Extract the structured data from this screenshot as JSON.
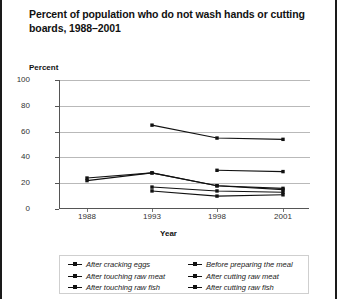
{
  "title": "Percent of population who do not wash hands or cutting boards, 1988–2001",
  "axis": {
    "y_label": "Percent",
    "x_label": "Year",
    "y_ticks": [
      "100",
      "80",
      "60",
      "40",
      "20",
      "0"
    ],
    "x_ticks": [
      "1988",
      "1993",
      "1998",
      "2001"
    ]
  },
  "legend": {
    "left": [
      "After cracking eggs",
      "After touching raw meat",
      "After touching raw fish"
    ],
    "right": [
      "Before preparing the meal",
      "After cutting raw meat",
      "After cutting raw fish"
    ]
  },
  "chart_data": {
    "type": "line",
    "title": "Percent of population who do not wash hands or cutting boards, 1988–2001",
    "xlabel": "Year",
    "ylabel": "Percent",
    "x": [
      1988,
      1993,
      1998,
      2001
    ],
    "categories": [
      "1988",
      "1993",
      "1998",
      "2001"
    ],
    "ylim": [
      0,
      100
    ],
    "yticks": [
      0,
      20,
      40,
      60,
      80,
      100
    ],
    "grid": true,
    "legend_position": "bottom",
    "line_color": "#111111",
    "marker": "square",
    "series": [
      {
        "name": "Before preparing the meal",
        "x": [
          1993,
          1998,
          2001
        ],
        "values": [
          65,
          55,
          54
        ]
      },
      {
        "name": "After cutting raw meat",
        "x": [
          1998,
          2001
        ],
        "values": [
          30,
          29
        ]
      },
      {
        "name": "After cracking eggs",
        "x": [
          1988,
          1993,
          1998,
          2001
        ],
        "values": [
          24,
          28,
          18,
          16
        ]
      },
      {
        "name": "After touching raw meat",
        "x": [
          1988,
          1993,
          1998,
          2001
        ],
        "values": [
          22,
          28,
          18,
          15
        ]
      },
      {
        "name": "After touching raw fish",
        "x": [
          1993,
          1998,
          2001
        ],
        "values": [
          17,
          14,
          13
        ]
      },
      {
        "name": "After cutting raw fish",
        "x": [
          1993,
          1998,
          2001
        ],
        "values": [
          14,
          10,
          11
        ]
      }
    ]
  }
}
